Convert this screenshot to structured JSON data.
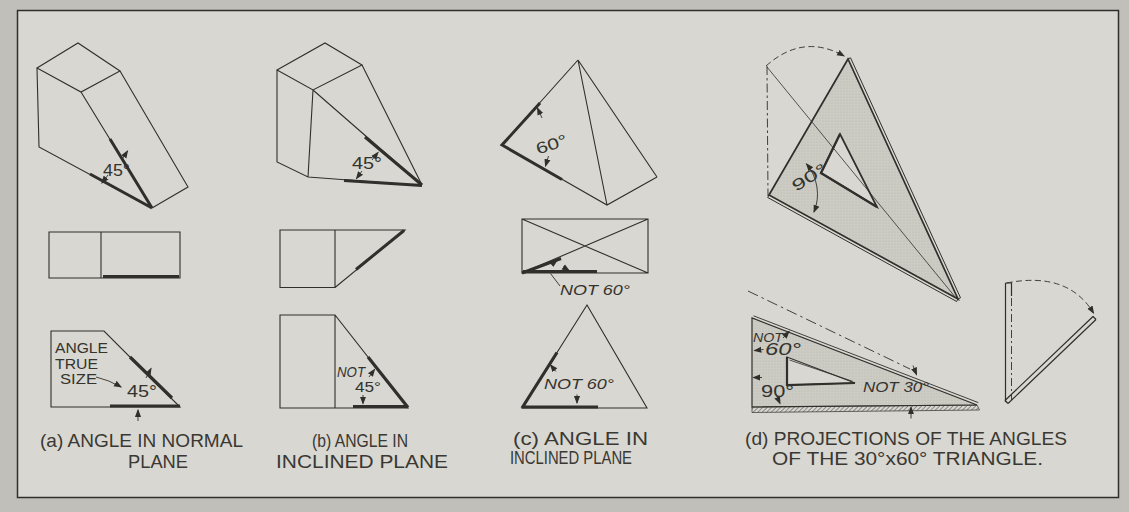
{
  "panels": {
    "a": {
      "caption": [
        "(a) ANGLE IN NORMAL",
        "PLANE"
      ],
      "iso_angle": "45°",
      "note": [
        "ANGLE",
        "TRUE",
        "SIZE"
      ],
      "front_angle": "45°"
    },
    "b": {
      "caption": [
        "(b) ANGLE IN",
        "INCLINED PLANE"
      ],
      "iso_angle": "45°",
      "front_not": "NOT",
      "front_angle": "45°"
    },
    "c": {
      "caption": [
        "(c) ANGLE IN",
        "INCLINED PLANE"
      ],
      "iso_angle": "60°",
      "top_note": "NOT 60°",
      "front_note": "NOT 60°"
    },
    "d": {
      "caption": [
        "(d) PROJECTIONS OF THE ANGLES",
        "OF THE 30°x60° TRIANGLE."
      ],
      "pictorial_angle": "90°",
      "front_not": "NOT",
      "front_60": "60°",
      "front_90": "90°",
      "front_not30": "NOT 30°"
    }
  },
  "colors": {
    "paper": "#d8d7d1",
    "mat": "#c0bfba",
    "ink": "#302f2b",
    "shade_fill": "#cccbc4"
  }
}
